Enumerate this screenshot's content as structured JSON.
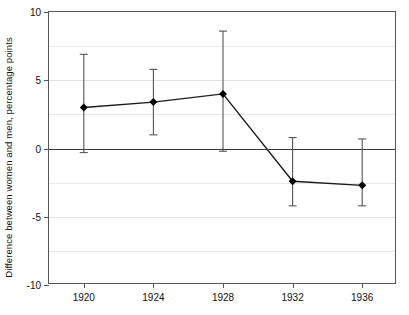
{
  "chart_data": {
    "type": "line",
    "title": "",
    "subtitle": "",
    "xlabel": "",
    "ylabel": "Difference between women and men, percentage points",
    "categories": [
      "1920",
      "1924",
      "1928",
      "1932",
      "1936"
    ],
    "x": [
      1920,
      1924,
      1928,
      1932,
      1936
    ],
    "xlim": [
      1918,
      1938
    ],
    "ylim": [
      -10,
      10
    ],
    "ytick_labels": [
      "10",
      "5",
      "0",
      "-5",
      "-10"
    ],
    "ytick_values": [
      10,
      5,
      0,
      -5,
      -10
    ],
    "gridlines": [
      7.5,
      5,
      2.5,
      -2.5,
      -5,
      -7.5
    ],
    "grid": true,
    "legend": null,
    "legend_position": "none",
    "marker": "filled-diamond",
    "error_bars": true,
    "zero_reference_line": 0,
    "series": [
      {
        "name": "Difference between women and men",
        "values": [
          3.0,
          3.4,
          4.0,
          -2.4,
          -2.7
        ],
        "error_upper": [
          6.9,
          5.8,
          8.6,
          0.8,
          0.7
        ],
        "error_lower": [
          -0.3,
          1.0,
          -0.2,
          -4.2,
          -4.2
        ]
      }
    ],
    "colors": {
      "line": "#1a1a1a",
      "marker": "#000000",
      "error_bar": "#555555",
      "grid": "#e8e8e8",
      "axis": "#555555",
      "zero_line": "#3a3a3a",
      "background": "#ffffff",
      "text": "#111111"
    }
  }
}
